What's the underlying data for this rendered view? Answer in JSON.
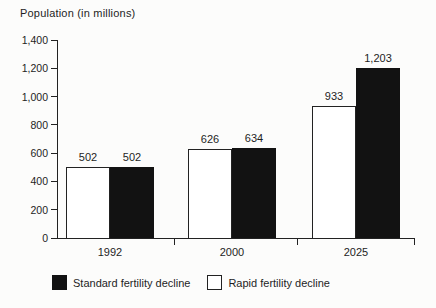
{
  "title": "Population (in millions)",
  "colors": {
    "background": "#fcfcfb",
    "text": "#1e1e1e",
    "axis": "#222222",
    "bar_standard": "#121212",
    "bar_rapid": "#ffffff"
  },
  "chart_data": {
    "type": "bar",
    "title": "Population (in millions)",
    "xlabel": "",
    "ylabel": "Population (in millions)",
    "categories": [
      "1992",
      "2000",
      "2025"
    ],
    "series": [
      {
        "name": "Rapid fertility decline",
        "style": "rapid",
        "values": [
          502,
          626,
          933
        ],
        "labels": [
          "502",
          "626",
          "933"
        ]
      },
      {
        "name": "Standard fertility decline",
        "style": "standard",
        "values": [
          502,
          634,
          1203
        ],
        "labels": [
          "502",
          "634",
          "1,203"
        ]
      }
    ],
    "ylim": [
      0,
      1400
    ],
    "ytick_step": 200,
    "yticks": [
      "0",
      "200",
      "400",
      "600",
      "800",
      "1,000",
      "1,200",
      "1,400"
    ],
    "grid": false,
    "legend_position": "bottom",
    "legend": [
      {
        "label": "Standard fertility decline",
        "swatch": "standard"
      },
      {
        "label": "Rapid fertility decline",
        "swatch": "rapid"
      }
    ]
  }
}
